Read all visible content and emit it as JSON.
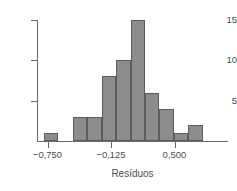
{
  "chart_data": {
    "type": "bar",
    "title": "",
    "subtitle": "",
    "xlabel": "Resíduos",
    "ylabel": "",
    "grid": false,
    "legend": null,
    "xlim": [
      -0.97,
      0.93
    ],
    "ylim": [
      0,
      15.5
    ],
    "xticks": [
      -0.75,
      -0.125,
      0.5
    ],
    "xtick_labels": [
      "−0,750",
      "−0,125",
      "0,500"
    ],
    "yticks": [
      5,
      10,
      15
    ],
    "ytick_labels": [
      "5",
      "10",
      "15"
    ],
    "bin_width": 0.142,
    "bin_starts": [
      -0.785,
      -0.643,
      -0.501,
      -0.359,
      -0.217,
      -0.075,
      0.067,
      0.209,
      0.351,
      0.493,
      0.635
    ],
    "categories": [
      "-0,785 to -0,643",
      "-0,643 to -0,501",
      "-0,501 to -0,359",
      "-0,359 to -0,217",
      "-0,217 to -0,075",
      "-0,075 to 0,067",
      "0,067 to 0,209",
      "0,209 to 0,351",
      "0,351 to 0,493",
      "0,493 to 0,635",
      "0,635 to 0,777"
    ],
    "values": [
      1,
      0,
      3,
      3,
      8,
      10,
      15,
      6,
      4,
      1,
      2
    ],
    "bar_color": "#8c8c8c",
    "bar_edge_color": "#5c5c5c",
    "axis_color": "#6b6b6b",
    "text_color": "#4d4d4d",
    "background_color": "#ffffff"
  },
  "axis": {
    "x_title": "Resíduos"
  }
}
